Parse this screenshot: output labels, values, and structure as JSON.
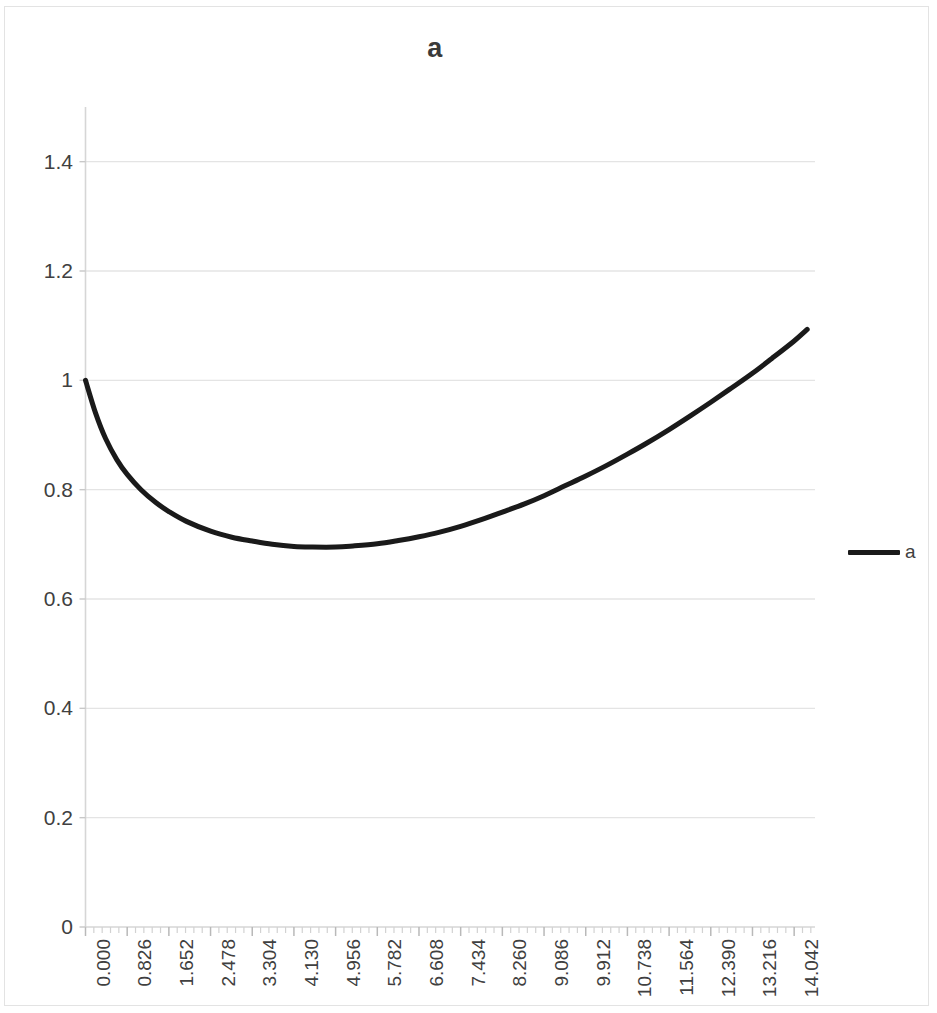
{
  "chart_data": {
    "type": "line",
    "title": "a",
    "xlabel": "",
    "ylabel": "",
    "grid": true,
    "legend_position": "right",
    "legend": [
      "a"
    ],
    "series_color": "#1a1a1a",
    "xlim": [
      0,
      14.455
    ],
    "ylim": [
      0,
      1.5
    ],
    "y_ticks": [
      "0",
      "0.2",
      "0.4",
      "0.6",
      "0.8",
      "1",
      "1.2",
      "1.4"
    ],
    "y_tick_values": [
      0,
      0.2,
      0.4,
      0.6,
      0.8,
      1,
      1.2,
      1.4
    ],
    "x_tick_labels": [
      "0.000",
      "0.826",
      "1.652",
      "2.478",
      "3.304",
      "4.130",
      "4.956",
      "5.782",
      "6.608",
      "7.434",
      "8.260",
      "9.086",
      "9.912",
      "10.738",
      "11.564",
      "12.390",
      "13.216",
      "14.042"
    ],
    "x_tick_values": [
      0.0,
      0.826,
      1.652,
      2.478,
      3.304,
      4.13,
      4.956,
      5.782,
      6.608,
      7.434,
      8.26,
      9.086,
      9.912,
      10.738,
      11.564,
      12.39,
      13.216,
      14.042
    ],
    "x_tick_step": 0.826,
    "minor_ticks_per_interval": 4,
    "series": [
      {
        "name": "a",
        "x": [
          0.0,
          0.2,
          0.4,
          0.62,
          0.826,
          1.1,
          1.4,
          1.652,
          2.0,
          2.478,
          2.9,
          3.304,
          3.7,
          4.13,
          4.5,
          4.956,
          5.3,
          5.782,
          6.2,
          6.608,
          7.0,
          7.434,
          7.9,
          8.26,
          8.7,
          9.086,
          9.5,
          9.912,
          10.3,
          10.738,
          11.1,
          11.564,
          12.0,
          12.39,
          12.8,
          13.216,
          13.6,
          14.042,
          14.3
        ],
        "y": [
          1.0,
          0.94,
          0.893,
          0.855,
          0.828,
          0.8,
          0.776,
          0.76,
          0.742,
          0.724,
          0.713,
          0.706,
          0.7,
          0.696,
          0.695,
          0.695,
          0.697,
          0.701,
          0.707,
          0.714,
          0.722,
          0.733,
          0.747,
          0.759,
          0.774,
          0.789,
          0.807,
          0.825,
          0.843,
          0.865,
          0.884,
          0.91,
          0.936,
          0.96,
          0.986,
          1.013,
          1.04,
          1.072,
          1.093
        ]
      }
    ],
    "minimum": {
      "x": 4.956,
      "y": 0.695
    },
    "start_point": {
      "x": 0.0,
      "y": 1.0
    },
    "end_point": {
      "x": 14.3,
      "y": 1.09
    }
  },
  "title": "a",
  "legend": {
    "label": "a"
  }
}
